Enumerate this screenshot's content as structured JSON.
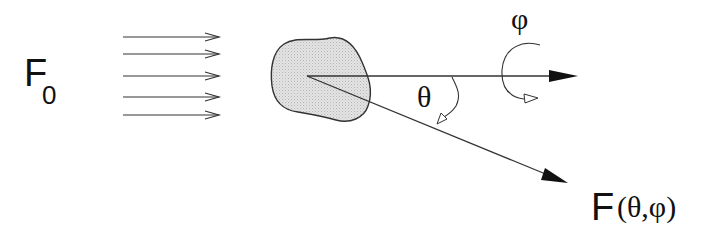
{
  "diagram": {
    "labels": {
      "incident_flux": {
        "main": "F",
        "subscript": "0"
      },
      "polar_angle": "θ",
      "azimuthal_angle": "φ",
      "scattered_flux": {
        "main": "F",
        "args": "(θ,φ)"
      }
    },
    "incident_rays": [
      {
        "y": 37
      },
      {
        "y": 54
      },
      {
        "y": 76
      },
      {
        "y": 97
      },
      {
        "y": 115
      }
    ],
    "incident_ray_x": [
      123,
      220
    ],
    "scatterer": {
      "shape": "irregular-blob",
      "fill": "#d9d9d9",
      "stroke": "#333333",
      "center": [
        307,
        76
      ]
    },
    "forward_axis": {
      "from": [
        307,
        76
      ],
      "to": [
        578,
        76
      ]
    },
    "scattered_ray": {
      "from": [
        307,
        76
      ],
      "to": [
        568,
        183
      ]
    },
    "colors": {
      "line": "#333333",
      "text": "#111111",
      "background": "#ffffff"
    }
  }
}
